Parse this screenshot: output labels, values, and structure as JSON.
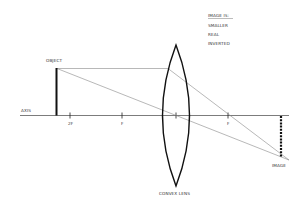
{
  "diagram": {
    "info_box": {
      "heading": "IMAGE IS:",
      "items": [
        "SMALLER",
        "REAL",
        "INVERTED"
      ]
    },
    "labels": {
      "object": "OBJECT",
      "axis": "AXIS",
      "two_f": "2F",
      "f_left": "F",
      "f_right": "F",
      "image": "IMAGE",
      "lens": "CONVEX LENS"
    },
    "colors": {
      "line": "#222222",
      "ray": "#777777",
      "background": "#ffffff"
    }
  }
}
